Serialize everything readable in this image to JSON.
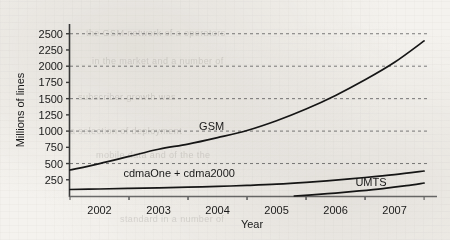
{
  "chart_data": {
    "type": "line",
    "title": "",
    "xlabel": "Year",
    "ylabel": "Millions of lines",
    "xlim": [
      2001.5,
      2007.6
    ],
    "ylim": [
      0,
      2650
    ],
    "grid": true,
    "grid_values": [
      500,
      1000,
      1500,
      2000,
      2500
    ],
    "legend": "inline-labels",
    "x_tick_labels": [
      "2002",
      "2003",
      "2004",
      "2005",
      "2006",
      "2007"
    ],
    "x_tick_values": [
      2002,
      2003,
      2004,
      2005,
      2006,
      2007
    ],
    "y_tick_labels": [
      "250",
      "500",
      "750",
      "1000",
      "1250",
      "1500",
      "1750",
      "2000",
      "2250",
      "2500"
    ],
    "y_tick_values": [
      250,
      500,
      750,
      1000,
      1250,
      1500,
      1750,
      2000,
      2250,
      2500
    ],
    "series": [
      {
        "name": "GSM",
        "label": "GSM",
        "x": [
          2001.5,
          2002.0,
          2002.5,
          2003.0,
          2003.5,
          2004.0,
          2004.5,
          2005.0,
          2005.5,
          2006.0,
          2006.5,
          2007.0,
          2007.5
        ],
        "values": [
          400,
          500,
          610,
          720,
          800,
          900,
          1010,
          1160,
          1340,
          1550,
          1790,
          2060,
          2390
        ]
      },
      {
        "name": "cdmaOne + cdma2000",
        "label": "cdmaOne + cdma2000",
        "x": [
          2001.5,
          2002.0,
          2002.5,
          2003.0,
          2003.5,
          2004.0,
          2004.5,
          2005.0,
          2005.5,
          2006.0,
          2006.5,
          2007.0,
          2007.5
        ],
        "values": [
          100,
          108,
          117,
          126,
          136,
          148,
          163,
          182,
          210,
          245,
          285,
          330,
          385
        ]
      },
      {
        "name": "UMTS",
        "label": "UMTS",
        "x": [
          2005.3,
          2005.6,
          2006.0,
          2006.4,
          2006.8,
          2007.2,
          2007.5
        ],
        "values": [
          0,
          18,
          45,
          78,
          115,
          160,
          200
        ]
      }
    ],
    "series_label_positions": [
      {
        "name": "GSM",
        "x": 2003.9,
        "y": 1020
      },
      {
        "name": "cdmaOne + cdma2000",
        "x": 2003.35,
        "y": 295
      },
      {
        "name": "UMTS",
        "x": 2006.6,
        "y": 150
      }
    ]
  },
  "scan_artifacts": {
    "bleed_lines": [
      "the GSM network of a operators",
      "in the market and a number of",
      "subscriber growth was",
      "a selection of deployment",
      "mobile data and of the the",
      "standard in a number of"
    ]
  }
}
